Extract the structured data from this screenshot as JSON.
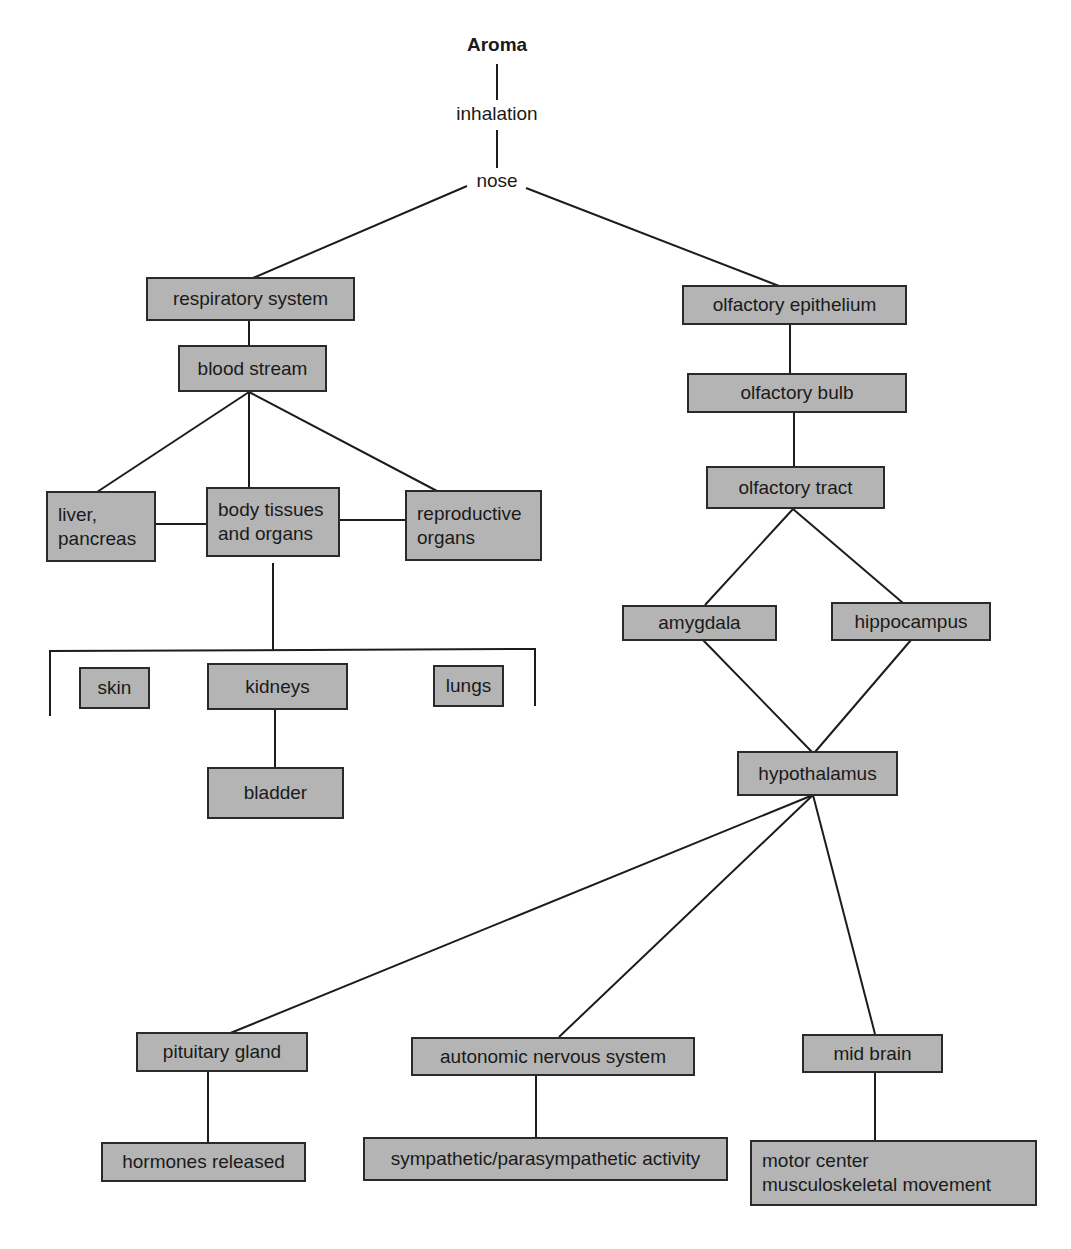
{
  "diagram": {
    "root": "Aroma",
    "path_labels": {
      "inhalation": "inhalation",
      "nose": "nose"
    },
    "left_branch": {
      "respiratory_system": "respiratory system",
      "blood_stream": "blood stream",
      "liver_pancreas": "liver,\npancreas",
      "body_tissues_organs": "body tissues\nand organs",
      "reproductive_organs": "reproductive\norgans",
      "skin": "skin",
      "kidneys": "kidneys",
      "lungs": "lungs",
      "bladder": "bladder"
    },
    "right_branch": {
      "olfactory_epithelium": "olfactory epithelium",
      "olfactory_bulb": "olfactory bulb",
      "olfactory_tract": "olfactory tract",
      "amygdala": "amygdala",
      "hippocampus": "hippocampus",
      "hypothalamus": "hypothalamus",
      "pituitary_gland": "pituitary  gland",
      "autonomic_nervous_system": "autonomic nervous system",
      "mid_brain": "mid brain",
      "hormones_released": "hormones released",
      "sympathetic_parasympathetic": "sympathetic/parasympathetic  activity",
      "motor_center": "motor center\nmusculoskeletal  movement"
    },
    "colors": {
      "box_fill": "#b4b4b4",
      "box_border": "#2a2a2a",
      "line": "#1c1c1c",
      "background": "#ffffff"
    }
  }
}
